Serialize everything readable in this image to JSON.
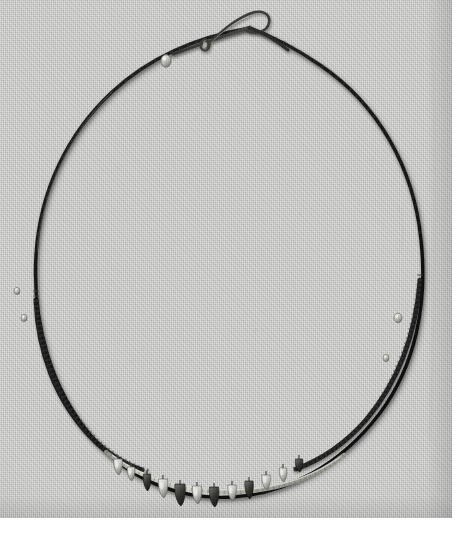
{
  "image": {
    "kind": "photograph",
    "medium": "black-and-white photographic print",
    "subject_title": "Beaded necklace with pendant drops and hook clasp",
    "caption": "Monochrome archival photograph of an ancient strung necklace laid flat in an open teardrop-shaped loop on a light grey woven cloth backing.",
    "orientation": "portrait",
    "width_px": 473,
    "height_px": 537,
    "print_area": {
      "x": 0,
      "y": 0,
      "width": 452,
      "height": 518
    },
    "margins": {
      "right_px": 21,
      "bottom_px": 19,
      "color": "#ffffff"
    }
  },
  "palette": {
    "paper_white": "#ffffff",
    "cloth_light": "#d4d4d2",
    "cloth_mid": "#c8c8c6",
    "cloth_shadow": "#b5b5b3",
    "cord_black": "#1c1c1c",
    "cord_dark": "#2c2c2c",
    "bead_highlight": "#e8e8e4",
    "bead_mid": "#9a9a96",
    "metal_light": "#c0c0bc",
    "pendant_shadow": "#55555 0"
  },
  "scene": {
    "background_label": "woven cloth backdrop",
    "lighting": "soft diffuse light from upper left",
    "shadow_direction": "lower right"
  },
  "artifact": {
    "name": "necklace",
    "form": "closed loop laid flat, teardrop / pear outline, widest across the lower half",
    "cord": {
      "label": "strung cord of small dark beads",
      "color": "#1c1c1c",
      "thickness_px": 3,
      "notes": "thin and even along the upper arcs, thickening and becoming visibly granular along the lower-left and lower-right quadrants where larger beads are strung"
    },
    "clasp": {
      "label": "hook-and-eye clasp",
      "position": "top centre-right",
      "color": "#4a4a4a",
      "parts": [
        "curved wire hook",
        "straight shank",
        "loop terminal",
        "small ring"
      ]
    },
    "lower_strand": {
      "label": "pale beaded section bearing the pendants",
      "color": "#b8b8b2",
      "position": "bottom centre arc"
    },
    "pendants": {
      "label": "small teardrop and claw-shaped pendant drops",
      "count": 12,
      "notes": "suspended from the pale lower strand; alternating bright highlighted and dark silhouetted forms"
    },
    "stray_beads": {
      "label": "isolated light beads along the upper arcs",
      "count": 6
    }
  },
  "geometry": {
    "loop_center": {
      "x": 222,
      "y": 268
    },
    "loop_radius_x": 185,
    "loop_radius_y": 222,
    "cord_path": "M 250 28 C 196 37, 150 57, 112 92 C 68 133, 40 190, 36 255 C 32 325, 52 390, 92 437 C 131 483, 184 500, 232 497 C 286 494, 340 466, 380 413 C 415 366, 428 305, 421 240 C 414 168, 378 104, 320 65 C 295 48, 272 36, 250 28 Z",
    "pale_strand_path": "M 106 452 C 140 480, 190 494, 240 492 C 282 490, 318 476, 344 455",
    "clasp_hook_path": "M 205 46 C 218 32, 234 20, 248 14 C 260 9, 270 12, 268 22 C 266 31, 254 34, 246 30",
    "clasp_shank_path": "M 173 54 C 196 46, 224 36, 250 27"
  },
  "pendant_items": [
    {
      "index": 1,
      "x": 118,
      "y": 459,
      "length": 16,
      "width": 8,
      "tone": "light"
    },
    {
      "index": 2,
      "x": 131,
      "y": 467,
      "length": 14,
      "width": 7,
      "tone": "light"
    },
    {
      "index": 3,
      "x": 147,
      "y": 474,
      "length": 17,
      "width": 7,
      "tone": "dark"
    },
    {
      "index": 4,
      "x": 163,
      "y": 479,
      "length": 19,
      "width": 9,
      "tone": "light"
    },
    {
      "index": 5,
      "x": 180,
      "y": 484,
      "length": 22,
      "width": 10,
      "tone": "dark"
    },
    {
      "index": 6,
      "x": 197,
      "y": 486,
      "length": 18,
      "width": 9,
      "tone": "light"
    },
    {
      "index": 7,
      "x": 214,
      "y": 487,
      "length": 20,
      "width": 9,
      "tone": "dark"
    },
    {
      "index": 8,
      "x": 232,
      "y": 485,
      "length": 16,
      "width": 8,
      "tone": "light"
    },
    {
      "index": 9,
      "x": 249,
      "y": 481,
      "length": 18,
      "width": 8,
      "tone": "dark"
    },
    {
      "index": 10,
      "x": 266,
      "y": 475,
      "length": 15,
      "width": 8,
      "tone": "light"
    },
    {
      "index": 11,
      "x": 283,
      "y": 468,
      "length": 14,
      "width": 7,
      "tone": "light"
    },
    {
      "index": 12,
      "x": 299,
      "y": 459,
      "length": 13,
      "width": 7,
      "tone": "dark"
    }
  ],
  "stray_bead_items": [
    {
      "index": 1,
      "x": 166,
      "y": 60,
      "r": 4.5,
      "tone": "light"
    },
    {
      "index": 2,
      "x": 206,
      "y": 44,
      "r": 3.5,
      "tone": "light"
    },
    {
      "index": 3,
      "x": 17,
      "y": 291,
      "r": 3.0,
      "tone": "light"
    },
    {
      "index": 4,
      "x": 24,
      "y": 318,
      "r": 3.0,
      "tone": "light"
    },
    {
      "index": 5,
      "x": 398,
      "y": 318,
      "r": 4.0,
      "tone": "light"
    },
    {
      "index": 6,
      "x": 386,
      "y": 358,
      "r": 3.0,
      "tone": "light"
    }
  ]
}
